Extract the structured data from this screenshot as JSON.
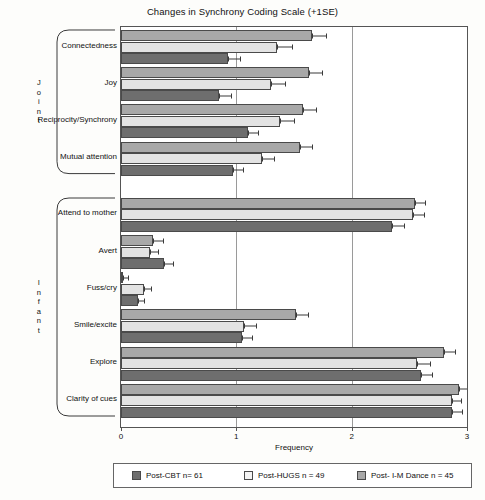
{
  "chart_data": {
    "type": "bar",
    "orientation": "horizontal",
    "title": "Changes in Synchrony Coding Scale (+1SE)",
    "xlabel": "Frequency",
    "ylabel": "",
    "xlim": [
      0,
      3
    ],
    "xticks": [
      0,
      1,
      2,
      3
    ],
    "xtick_labels": [
      "0",
      "1",
      "2",
      "3"
    ],
    "grid": true,
    "grid_axis": "x",
    "legend_position": "bottom",
    "categories": [
      "Connectedness",
      "Joy",
      "Reciprocity/Synchrony",
      "Mutual attention",
      "Attend to mother",
      "Avert",
      "Fuss/cry",
      "Smile/excite",
      "Explore",
      "Clarity of cues"
    ],
    "series": [
      {
        "name": "Post- I-M Dance n = 45",
        "color": "#a8a8a8",
        "values": [
          1.66,
          1.63,
          1.58,
          1.55,
          2.55,
          0.28,
          0.02,
          1.52,
          2.8,
          2.93
        ],
        "errors": [
          0.12,
          0.11,
          0.11,
          0.11,
          0.09,
          0.08,
          0.04,
          0.1,
          0.1,
          0.07
        ]
      },
      {
        "name": "Post-HUGS n = 49",
        "color": "#e3e3e3",
        "values": [
          1.35,
          1.3,
          1.38,
          1.22,
          2.53,
          0.25,
          0.2,
          1.07,
          2.57,
          2.87
        ],
        "errors": [
          0.13,
          0.12,
          0.12,
          0.11,
          0.1,
          0.07,
          0.06,
          0.1,
          0.11,
          0.08
        ]
      },
      {
        "name": "Post-CBT n= 61",
        "color": "#6e6e6e",
        "values": [
          0.93,
          0.85,
          1.1,
          0.97,
          2.35,
          0.37,
          0.15,
          1.05,
          2.6,
          2.87
        ],
        "errors": [
          0.1,
          0.1,
          0.09,
          0.09,
          0.1,
          0.08,
          0.05,
          0.09,
          0.1,
          0.09
        ]
      }
    ],
    "groups": [
      {
        "label": "Joint",
        "letters": [
          "J",
          "o",
          "i",
          "n",
          "t"
        ],
        "from": 0,
        "to": 3
      },
      {
        "label": "Infant",
        "letters": [
          "I",
          "n",
          "f",
          "a",
          "n",
          "t"
        ],
        "from": 4,
        "to": 9
      }
    ]
  },
  "legend": {
    "items": [
      {
        "label": "Post-CBT n= 61",
        "color": "#6e6e6e"
      },
      {
        "label": "Post-HUGS n = 49",
        "color": "#f4f4f4"
      },
      {
        "label": "Post- I-M Dance n = 45",
        "color": "#a8a8a8"
      }
    ]
  }
}
